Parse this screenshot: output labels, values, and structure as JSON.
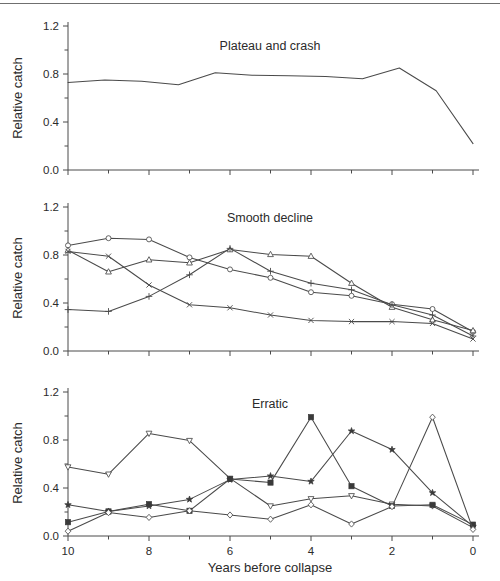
{
  "figure": {
    "width": 500,
    "height": 581,
    "background_color": "#ffffff",
    "line_color": "#4a4a4a",
    "text_color": "#2b2b2b",
    "top_rule_color": "#6f6f6f"
  },
  "axis": {
    "x_title": "Years before collapse",
    "y_title": "Relative catch",
    "x_ticks_major": [
      "10",
      "8",
      "6",
      "4",
      "2",
      "0"
    ],
    "x_tick_values_major": [
      10,
      8,
      6,
      4,
      2,
      0
    ],
    "x_tick_values_minor": [
      9,
      7,
      5,
      3,
      1
    ],
    "y_ticks_major": [
      "0.0",
      "0.4",
      "0.8",
      "1.2"
    ],
    "y_tick_values_major": [
      0.0,
      0.4,
      0.8,
      1.2
    ],
    "y_tick_values_minor": [
      0.2,
      0.6,
      1.0
    ],
    "xlim": [
      10,
      0
    ],
    "ylim": [
      0.0,
      1.2
    ],
    "grid": false
  },
  "chart_data": [
    {
      "type": "line",
      "title": "Plateau and crash",
      "xlabel": "",
      "ylabel": "Relative catch",
      "xlim": [
        10,
        0
      ],
      "ylim": [
        0.0,
        1.2
      ],
      "grid": false,
      "legend": "none",
      "x": [
        10,
        9,
        8,
        7,
        6,
        5,
        4,
        3,
        2,
        1,
        0
      ],
      "series": [
        {
          "name": "plateau-and-crash",
          "marker": "none",
          "values": [
            0.73,
            0.75,
            0.74,
            0.71,
            0.81,
            0.79,
            0.785,
            0.78,
            0.76,
            0.85,
            0.66,
            0.22
          ]
        }
      ]
    },
    {
      "type": "line",
      "title": "Smooth decline",
      "xlabel": "",
      "ylabel": "Relative catch",
      "xlim": [
        10,
        0
      ],
      "ylim": [
        0.0,
        1.2
      ],
      "grid": false,
      "legend": "none",
      "x": [
        10,
        9,
        8,
        7,
        6,
        5,
        4,
        3,
        2,
        1,
        0
      ],
      "series": [
        {
          "name": "smooth-decline-circle",
          "marker": "circle",
          "values": [
            0.88,
            0.94,
            0.93,
            0.78,
            0.68,
            0.61,
            0.49,
            0.46,
            0.39,
            0.35,
            0.16
          ]
        },
        {
          "name": "smooth-decline-triangle",
          "marker": "triangle-up",
          "values": [
            0.84,
            0.66,
            0.76,
            0.735,
            0.845,
            0.805,
            0.79,
            0.565,
            0.365,
            0.26,
            0.17
          ]
        },
        {
          "name": "smooth-decline-cross",
          "marker": "x",
          "values": [
            0.83,
            0.79,
            0.55,
            0.385,
            0.36,
            0.3,
            0.255,
            0.245,
            0.245,
            0.23,
            0.1
          ]
        },
        {
          "name": "smooth-decline-plus",
          "marker": "plus",
          "values": [
            0.345,
            0.33,
            0.455,
            0.635,
            0.855,
            0.665,
            0.565,
            0.51,
            0.385,
            0.3,
            0.125
          ]
        }
      ]
    },
    {
      "type": "line",
      "title": "Erratic",
      "xlabel": "Years before collapse",
      "ylabel": "Relative catch",
      "xlim": [
        10,
        0
      ],
      "ylim": [
        0.0,
        1.2
      ],
      "grid": false,
      "legend": "none",
      "x": [
        10,
        9,
        8,
        7,
        6,
        5,
        4,
        3,
        2,
        1,
        0
      ],
      "series": [
        {
          "name": "erratic-down-triangle",
          "marker": "triangle-down",
          "values": [
            0.575,
            0.515,
            0.855,
            0.795,
            0.48,
            0.25,
            0.31,
            0.335,
            0.265,
            0.25,
            0.07
          ]
        },
        {
          "name": "erratic-square",
          "marker": "square",
          "values": [
            0.115,
            0.205,
            0.265,
            0.21,
            0.475,
            0.445,
            0.99,
            0.415,
            0.25,
            0.26,
            0.095
          ]
        },
        {
          "name": "erratic-star",
          "marker": "star",
          "values": [
            0.26,
            0.205,
            0.25,
            0.305,
            0.47,
            0.5,
            0.455,
            0.875,
            0.72,
            0.36,
            0.08
          ]
        },
        {
          "name": "erratic-diamond",
          "marker": "diamond",
          "values": [
            0.04,
            0.195,
            0.155,
            0.21,
            0.175,
            0.14,
            0.26,
            0.1,
            0.245,
            0.99,
            0.055
          ]
        }
      ]
    }
  ],
  "panels": [
    {
      "title": "Plateau and crash",
      "index": 0
    },
    {
      "title": "Smooth decline",
      "index": 1
    },
    {
      "title": "Erratic",
      "index": 2
    }
  ]
}
